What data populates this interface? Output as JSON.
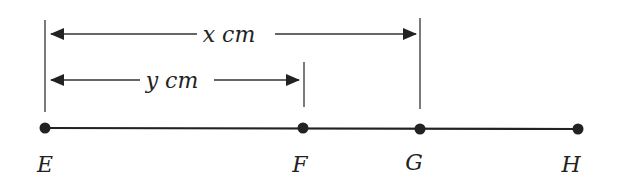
{
  "diagram": {
    "type": "line-segment-with-dimensions",
    "colors": {
      "line": "#222222",
      "background": "#ffffff"
    },
    "points": [
      {
        "name": "E",
        "label": "E",
        "x": 45,
        "y": 128
      },
      {
        "name": "F",
        "label": "F",
        "x": 303,
        "y": 128
      },
      {
        "name": "G",
        "label": "G",
        "x": 420,
        "y": 129
      },
      {
        "name": "H",
        "label": "H",
        "x": 578,
        "y": 129
      }
    ],
    "dimensions": [
      {
        "name": "EG",
        "label": "x cm",
        "from": "E",
        "to": "G"
      },
      {
        "name": "EF",
        "label": "y cm",
        "from": "E",
        "to": "F"
      }
    ]
  }
}
